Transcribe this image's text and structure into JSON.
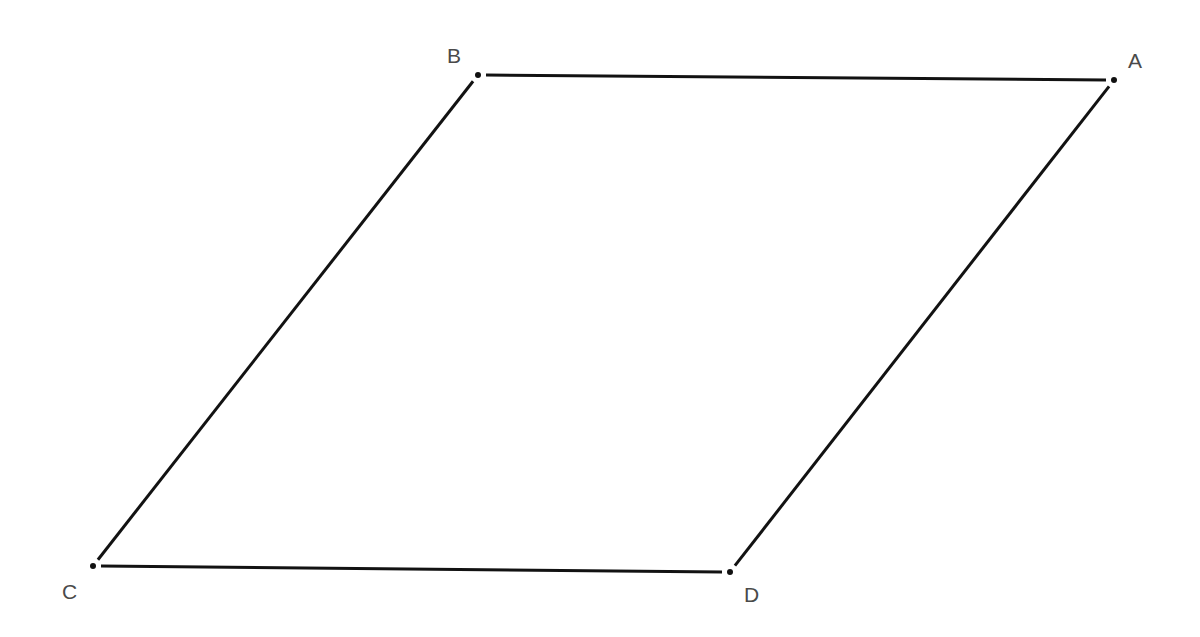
{
  "diagram": {
    "type": "parallelogram",
    "colors": {
      "background": "#ffffff",
      "edge": "#121212",
      "point": "#111111",
      "label": "#4a4a4a"
    },
    "vertices": [
      {
        "id": "A",
        "label": "A",
        "x": 1114,
        "y": 80,
        "label_x": 1128,
        "label_y": 68
      },
      {
        "id": "B",
        "label": "B",
        "x": 478,
        "y": 75,
        "label_x": 447,
        "label_y": 63
      },
      {
        "id": "C",
        "label": "C",
        "x": 93,
        "y": 566,
        "label_x": 62,
        "label_y": 599
      },
      {
        "id": "D",
        "label": "D",
        "x": 730,
        "y": 572,
        "label_x": 744,
        "label_y": 602
      }
    ],
    "edges": [
      {
        "id": "AB",
        "from": "B",
        "to": "A"
      },
      {
        "id": "BC",
        "from": "B",
        "to": "C"
      },
      {
        "id": "CD",
        "from": "C",
        "to": "D"
      },
      {
        "id": "DA",
        "from": "D",
        "to": "A"
      }
    ]
  }
}
